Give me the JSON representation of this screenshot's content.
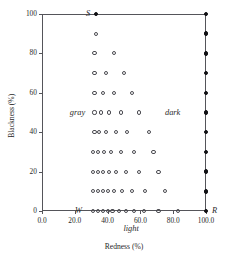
{
  "chart_data": {
    "type": "scatter",
    "title": "",
    "xlabel": "Redness (%)",
    "ylabel": "Blackness (%)",
    "xlim": [
      0,
      100
    ],
    "ylim": [
      0,
      100
    ],
    "grid": false,
    "legend": "none",
    "xticks": [
      "0.0",
      "20.0",
      "40.0",
      "60.0",
      "80.0",
      "100.0"
    ],
    "xtickvalues": [
      0,
      20,
      40,
      60,
      80,
      100
    ],
    "yticks": [
      "0",
      "20",
      "40",
      "60",
      "80",
      "100"
    ],
    "ytickvalues": [
      0,
      20,
      40,
      60,
      80,
      100
    ],
    "series": [
      {
        "name": "open-markers",
        "marker": "open-circle",
        "color": "#4a4a50",
        "points": [
          [
            31,
            0
          ],
          [
            34,
            0
          ],
          [
            37,
            0
          ],
          [
            40,
            0
          ],
          [
            43,
            0
          ],
          [
            47,
            0
          ],
          [
            51,
            0
          ],
          [
            56,
            0
          ],
          [
            62,
            0
          ],
          [
            71,
            0
          ],
          [
            83,
            0
          ],
          [
            31,
            10
          ],
          [
            34,
            10
          ],
          [
            37,
            10
          ],
          [
            40,
            10
          ],
          [
            44,
            10
          ],
          [
            49,
            10
          ],
          [
            55,
            10
          ],
          [
            63,
            10
          ],
          [
            75,
            10
          ],
          [
            31,
            20
          ],
          [
            34,
            20
          ],
          [
            37,
            20
          ],
          [
            41,
            20
          ],
          [
            45,
            20
          ],
          [
            51,
            20
          ],
          [
            59,
            20
          ],
          [
            71,
            20
          ],
          [
            31,
            30
          ],
          [
            34,
            30
          ],
          [
            38,
            30
          ],
          [
            42,
            30
          ],
          [
            48,
            30
          ],
          [
            56,
            30
          ],
          [
            68,
            30
          ],
          [
            32,
            40
          ],
          [
            35,
            40
          ],
          [
            39,
            40
          ],
          [
            45,
            40
          ],
          [
            52,
            40
          ],
          [
            65,
            40
          ],
          [
            32,
            50
          ],
          [
            36,
            50
          ],
          [
            41,
            50
          ],
          [
            48,
            50
          ],
          [
            59,
            50
          ],
          [
            32,
            60
          ],
          [
            37,
            60
          ],
          [
            44,
            60
          ],
          [
            55,
            60
          ],
          [
            32,
            70
          ],
          [
            39,
            70
          ],
          [
            50,
            70
          ],
          [
            32,
            80
          ],
          [
            44,
            80
          ],
          [
            33,
            90
          ]
        ]
      },
      {
        "name": "filled-markers",
        "marker": "filled-circle",
        "color": "#111114",
        "points": [
          [
            33,
            100
          ],
          [
            100,
            0
          ],
          [
            100,
            10
          ],
          [
            100,
            20
          ],
          [
            100,
            30
          ],
          [
            100,
            40
          ],
          [
            100,
            50
          ],
          [
            100,
            60
          ],
          [
            100,
            70
          ],
          [
            100,
            80
          ],
          [
            100,
            90
          ],
          [
            100,
            100
          ]
        ]
      }
    ],
    "annotations": [
      {
        "text": "S",
        "x": 33,
        "y": 100,
        "align": "left-of"
      },
      {
        "text": "W",
        "x": 28,
        "y": 0,
        "align": "left-of"
      },
      {
        "text": "R",
        "x": 100,
        "y": 0,
        "align": "right-of"
      },
      {
        "text": "gray",
        "x": 30,
        "y": 50,
        "align": "left-of"
      },
      {
        "text": "dark",
        "x": 88,
        "y": 50,
        "align": "left-of"
      },
      {
        "text": "light",
        "x": 46,
        "y": -9,
        "align": "right-of"
      }
    ]
  }
}
